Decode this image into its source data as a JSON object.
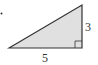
{
  "diagram": {
    "type": "right-triangle",
    "base_label": "5",
    "height_label": "3",
    "fill_color": "#e0e0e0",
    "stroke_color": "#333333",
    "right_angle_marker": true
  }
}
